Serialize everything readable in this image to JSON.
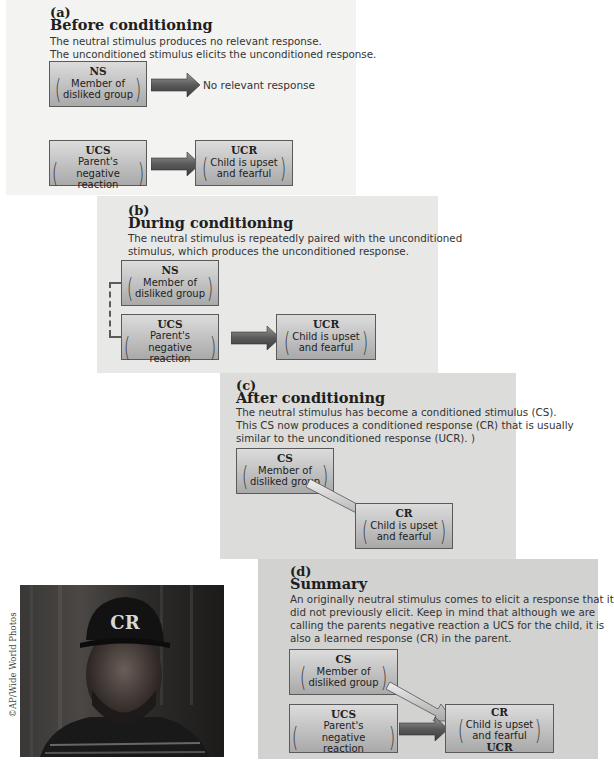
{
  "panels": {
    "a": {
      "letter": "(a)",
      "title": "Before conditioning",
      "desc_lines": [
        "The neutral stimulus produces no relevant response.",
        "The unconditioned stimulus elicits the unconditioned response."
      ],
      "ns": {
        "label": "NS",
        "text1": "Member of",
        "text2": "disliked group"
      },
      "no_response": "No relevant response",
      "ucs": {
        "label": "UCS",
        "text1": "Parent's negative",
        "text2": "reaction"
      },
      "ucr": {
        "label": "UCR",
        "text1": "Child is upset",
        "text2": "and fearful"
      }
    },
    "b": {
      "letter": "(b)",
      "title": "During conditioning",
      "desc_lines": [
        "The neutral stimulus is repeatedly paired with the unconditioned",
        "stimulus, which produces the unconditioned response."
      ],
      "ns": {
        "label": "NS",
        "text1": "Member of",
        "text2": "disliked group"
      },
      "ucs": {
        "label": "UCS",
        "text1": "Parent's negative",
        "text2": "reaction"
      },
      "ucr": {
        "label": "UCR",
        "text1": "Child is upset",
        "text2": "and fearful"
      }
    },
    "c": {
      "letter": "(c)",
      "title": "After conditioning",
      "desc_lines": [
        "The neutral stimulus has become a conditioned stimulus (CS).",
        "This CS now produces a conditioned response (CR) that is usually",
        "similar to the unconditioned response (UCR). )"
      ],
      "cs": {
        "label": "CS",
        "text1": "Member of",
        "text2": "disliked group"
      },
      "cr": {
        "label": "CR",
        "text1": "Child is upset",
        "text2": "and fearful"
      }
    },
    "d": {
      "letter": "(d)",
      "title": "Summary",
      "desc_lines": [
        "An originally neutral stimulus comes to elicit a response that it",
        "did not previously elicit. Keep in mind that although we are",
        "calling the parents negative reaction a UCS for the child, it is",
        "also a learned response (CR) in the parent."
      ],
      "cs": {
        "label": "CS",
        "text1": "Member of",
        "text2": "disliked group"
      },
      "ucs": {
        "label": "UCS",
        "text1": "Parent's negative",
        "text2": "reaction"
      },
      "cr": {
        "label": "CR",
        "text1": "Child is upset",
        "text2": "and fearful",
        "footer": "UCR"
      }
    }
  },
  "photo": {
    "credit": "©AP/Wide World Photos",
    "cap_logo": "CR"
  },
  "colors": {
    "panel_a": "#f3f3f2",
    "panel_b": "#e8e8e7",
    "panel_c": "#dcdcdb",
    "panel_d": "#d2d2d1",
    "arrow_dark": "#5b5b5b",
    "box_border": "#5a5a5a"
  }
}
